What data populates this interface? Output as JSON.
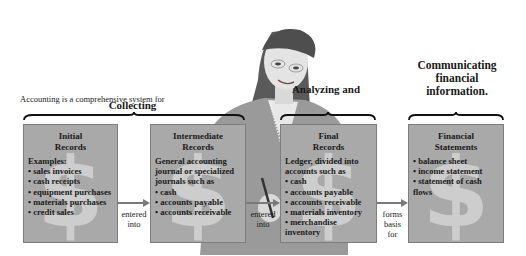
{
  "intro_text": "Accounting is a comprehensive system for",
  "phases": {
    "collecting": "Collecting",
    "analyzing": "Analyzing and",
    "communicating": "Communicating financial information."
  },
  "boxes": [
    {
      "title_line1": "Initial",
      "title_line2": "Records",
      "intro": "Examples:",
      "items": [
        "sales invoices",
        "cash receipts",
        "equipment purchases",
        "materials purchases",
        "credit sales"
      ]
    },
    {
      "title_line1": "Intermediate",
      "title_line2": "Records",
      "intro": "General accounting journal or specialized journals such as",
      "items": [
        "cash",
        "accounts payable",
        "accounts receivable"
      ]
    },
    {
      "title_line1": "Final",
      "title_line2": "Records",
      "intro": "Ledger, divided into accounts such as",
      "items": [
        "cash",
        "accounts payable",
        "accounts receivable",
        "materials inventory",
        "merchandise inventory"
      ]
    },
    {
      "title_line1": "Financial",
      "title_line2": "Statements",
      "intro": "",
      "items": [
        "balance sheet",
        "income statement",
        "statement of cash flows"
      ]
    }
  ],
  "connectors": [
    {
      "line1": "entered",
      "line2": "into",
      "line3": ""
    },
    {
      "line1": "entered",
      "line2": "into",
      "line3": ""
    },
    {
      "line1": "forms",
      "line2": "basis",
      "line3": "for"
    }
  ],
  "icons": {
    "box_watermark": "$"
  },
  "colors": {
    "box_fill": "#a9a9a9",
    "watermark": "#cdcdcd",
    "arrow": "#7a7a7a"
  }
}
